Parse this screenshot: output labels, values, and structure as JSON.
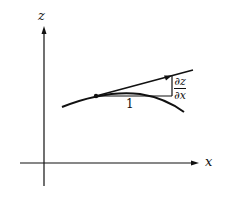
{
  "diagram": {
    "axes": {
      "vertical_label": "z",
      "horizontal_label": "x"
    },
    "annotations": {
      "run_label": "1",
      "slope_numerator": "∂z",
      "slope_denominator": "∂x"
    },
    "elements": {
      "curve": "concave-down curve",
      "tangent_line": "tangent line at point",
      "point": "point of tangency",
      "slope_triangle": "run 1, rise ∂z/∂x"
    }
  }
}
